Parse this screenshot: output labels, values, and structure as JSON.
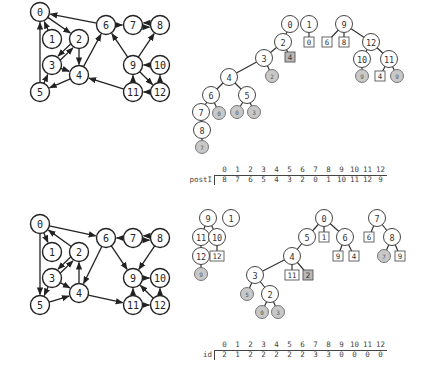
{
  "panels": [
    {
      "name": "top",
      "graph": {
        "nodes": [
          {
            "id": "0",
            "x": 40,
            "y": 12
          },
          {
            "id": "1",
            "x": 52,
            "y": 39
          },
          {
            "id": "2",
            "x": 79,
            "y": 39
          },
          {
            "id": "3",
            "x": 52,
            "y": 65
          },
          {
            "id": "4",
            "x": 79,
            "y": 75
          },
          {
            "id": "5",
            "x": 40,
            "y": 92
          },
          {
            "id": "6",
            "x": 106,
            "y": 25
          },
          {
            "id": "7",
            "x": 133,
            "y": 25
          },
          {
            "id": "8",
            "x": 160,
            "y": 25
          },
          {
            "id": "9",
            "x": 133,
            "y": 65
          },
          {
            "id": "10",
            "x": 160,
            "y": 65
          },
          {
            "id": "11",
            "x": 133,
            "y": 92
          },
          {
            "id": "12",
            "x": 160,
            "y": 92
          }
        ],
        "edges": [
          [
            "1",
            "0"
          ],
          [
            "0",
            "2"
          ],
          [
            "2",
            "3"
          ],
          [
            "3",
            "2"
          ],
          [
            "2",
            "4"
          ],
          [
            "3",
            "4"
          ],
          [
            "4",
            "5"
          ],
          [
            "5",
            "3"
          ],
          [
            "5",
            "0"
          ],
          [
            "4",
            "6"
          ],
          [
            "6",
            "0"
          ],
          [
            "6",
            "7"
          ],
          [
            "7",
            "8"
          ],
          [
            "8",
            "7"
          ],
          [
            "9",
            "6"
          ],
          [
            "9",
            "8"
          ],
          [
            "10",
            "9"
          ],
          [
            "9",
            "12"
          ],
          [
            "11",
            "9"
          ],
          [
            "12",
            "11"
          ],
          [
            "11",
            "4"
          ],
          [
            "12",
            "10"
          ]
        ]
      },
      "forest": {
        "nodes": [
          {
            "id": "t0",
            "label": "0",
            "x": 290,
            "y": 24,
            "kind": "circle"
          },
          {
            "id": "t2",
            "label": "2",
            "x": 283,
            "y": 42,
            "kind": "circle"
          },
          {
            "id": "t4b",
            "label": "4",
            "x": 290,
            "y": 57,
            "kind": "box-grey"
          },
          {
            "id": "t3",
            "label": "3",
            "x": 264,
            "y": 58,
            "kind": "circle"
          },
          {
            "id": "t2g",
            "label": "2",
            "x": 272,
            "y": 76,
            "kind": "grey"
          },
          {
            "id": "t4",
            "label": "4",
            "x": 229,
            "y": 77,
            "kind": "circle"
          },
          {
            "id": "t6",
            "label": "6",
            "x": 211,
            "y": 95,
            "kind": "circle"
          },
          {
            "id": "t5",
            "label": "5",
            "x": 247,
            "y": 95,
            "kind": "circle"
          },
          {
            "id": "t7",
            "label": "7",
            "x": 201,
            "y": 112,
            "kind": "circle"
          },
          {
            "id": "t0g",
            "label": "0",
            "x": 219,
            "y": 113,
            "kind": "grey"
          },
          {
            "id": "t0g2",
            "label": "0",
            "x": 237,
            "y": 112,
            "kind": "grey"
          },
          {
            "id": "t3g",
            "label": "3",
            "x": 254,
            "y": 112,
            "kind": "grey"
          },
          {
            "id": "t8",
            "label": "8",
            "x": 202,
            "y": 130,
            "kind": "circle"
          },
          {
            "id": "t7g",
            "label": "7",
            "x": 202,
            "y": 147,
            "kind": "grey"
          },
          {
            "id": "t1",
            "label": "1",
            "x": 309,
            "y": 24,
            "kind": "circle"
          },
          {
            "id": "t0b",
            "label": "0",
            "x": 309,
            "y": 42,
            "kind": "box"
          },
          {
            "id": "t9",
            "label": "9",
            "x": 344,
            "y": 24,
            "kind": "circle"
          },
          {
            "id": "t6b",
            "label": "6",
            "x": 327,
            "y": 42,
            "kind": "box"
          },
          {
            "id": "t8b",
            "label": "8",
            "x": 344,
            "y": 42,
            "kind": "box"
          },
          {
            "id": "t12",
            "label": "12",
            "x": 371,
            "y": 42,
            "kind": "circle"
          },
          {
            "id": "t10",
            "label": "10",
            "x": 362,
            "y": 59,
            "kind": "circle"
          },
          {
            "id": "t11",
            "label": "11",
            "x": 389,
            "y": 59,
            "kind": "circle"
          },
          {
            "id": "t9g",
            "label": "9",
            "x": 362,
            "y": 76,
            "kind": "grey"
          },
          {
            "id": "t4b2",
            "label": "4",
            "x": 380,
            "y": 76,
            "kind": "box"
          },
          {
            "id": "t9g2",
            "label": "9",
            "x": 397,
            "y": 76,
            "kind": "grey"
          }
        ],
        "edges": [
          [
            "t0",
            "t2"
          ],
          [
            "t2",
            "t4b"
          ],
          [
            "t2",
            "t3"
          ],
          [
            "t3",
            "t2g"
          ],
          [
            "t3",
            "t4"
          ],
          [
            "t4",
            "t6"
          ],
          [
            "t4",
            "t5"
          ],
          [
            "t6",
            "t7"
          ],
          [
            "t6",
            "t0g"
          ],
          [
            "t5",
            "t0g2"
          ],
          [
            "t5",
            "t3g"
          ],
          [
            "t7",
            "t8"
          ],
          [
            "t8",
            "t7g"
          ],
          [
            "t1",
            "t0b"
          ],
          [
            "t9",
            "t6b"
          ],
          [
            "t9",
            "t8b"
          ],
          [
            "t9",
            "t12"
          ],
          [
            "t12",
            "t10"
          ],
          [
            "t12",
            "t11"
          ],
          [
            "t10",
            "t9g"
          ],
          [
            "t11",
            "t4b2"
          ],
          [
            "t11",
            "t9g2"
          ]
        ]
      },
      "array": {
        "label": "postI",
        "indices": [
          "0",
          "1",
          "2",
          "3",
          "4",
          "5",
          "6",
          "7",
          "8",
          "9",
          "10",
          "11",
          "12"
        ],
        "values": [
          "8",
          "7",
          "6",
          "5",
          "4",
          "3",
          "2",
          "0",
          "1",
          "10",
          "11",
          "12",
          "9"
        ],
        "x": 218,
        "y": 165
      }
    },
    {
      "name": "bottom",
      "graph": {
        "nodes": [
          {
            "id": "0",
            "x": 40,
            "y": 224
          },
          {
            "id": "1",
            "x": 52,
            "y": 252
          },
          {
            "id": "2",
            "x": 79,
            "y": 252
          },
          {
            "id": "3",
            "x": 52,
            "y": 278
          },
          {
            "id": "4",
            "x": 79,
            "y": 293
          },
          {
            "id": "5",
            "x": 40,
            "y": 305
          },
          {
            "id": "6",
            "x": 106,
            "y": 238
          },
          {
            "id": "7",
            "x": 133,
            "y": 238
          },
          {
            "id": "8",
            "x": 160,
            "y": 238
          },
          {
            "id": "9",
            "x": 133,
            "y": 278
          },
          {
            "id": "10",
            "x": 160,
            "y": 278
          },
          {
            "id": "11",
            "x": 133,
            "y": 305
          },
          {
            "id": "12",
            "x": 160,
            "y": 305
          }
        ],
        "edges": [
          [
            "0",
            "1"
          ],
          [
            "2",
            "0"
          ],
          [
            "0",
            "5"
          ],
          [
            "0",
            "6"
          ],
          [
            "3",
            "2"
          ],
          [
            "2",
            "3"
          ],
          [
            "4",
            "2"
          ],
          [
            "3",
            "4"
          ],
          [
            "3",
            "5"
          ],
          [
            "5",
            "4"
          ],
          [
            "6",
            "4"
          ],
          [
            "6",
            "9"
          ],
          [
            "7",
            "6"
          ],
          [
            "7",
            "8"
          ],
          [
            "8",
            "7"
          ],
          [
            "8",
            "9"
          ],
          [
            "9",
            "10"
          ],
          [
            "11",
            "9"
          ],
          [
            "12",
            "9"
          ],
          [
            "4",
            "11"
          ],
          [
            "11",
            "12"
          ],
          [
            "12",
            "10"
          ]
        ]
      },
      "forest": {
        "nodes": [
          {
            "id": "b9",
            "label": "9",
            "x": 208,
            "y": 218,
            "kind": "circle"
          },
          {
            "id": "b1",
            "label": "1",
            "x": 231,
            "y": 218,
            "kind": "circle"
          },
          {
            "id": "b11",
            "label": "11",
            "x": 201,
            "y": 237,
            "kind": "circle"
          },
          {
            "id": "b10",
            "label": "10",
            "x": 217,
            "y": 237,
            "kind": "circle"
          },
          {
            "id": "b12",
            "label": "12",
            "x": 201,
            "y": 256,
            "kind": "circle"
          },
          {
            "id": "b12b",
            "label": "12",
            "x": 217,
            "y": 256,
            "kind": "box"
          },
          {
            "id": "b9g",
            "label": "9",
            "x": 201,
            "y": 274,
            "kind": "grey"
          },
          {
            "id": "b0",
            "label": "0",
            "x": 324,
            "y": 218,
            "kind": "circle"
          },
          {
            "id": "b5",
            "label": "5",
            "x": 307,
            "y": 237,
            "kind": "circle"
          },
          {
            "id": "b1b",
            "label": "1",
            "x": 324,
            "y": 237,
            "kind": "box"
          },
          {
            "id": "b6",
            "label": "6",
            "x": 345,
            "y": 237,
            "kind": "circle"
          },
          {
            "id": "b9b",
            "label": "9",
            "x": 338,
            "y": 256,
            "kind": "box"
          },
          {
            "id": "b4b",
            "label": "4",
            "x": 354,
            "y": 256,
            "kind": "box"
          },
          {
            "id": "b4",
            "label": "4",
            "x": 292,
            "y": 256,
            "kind": "circle"
          },
          {
            "id": "b11b",
            "label": "11",
            "x": 292,
            "y": 275,
            "kind": "box"
          },
          {
            "id": "b2b",
            "label": "2",
            "x": 308,
            "y": 275,
            "kind": "box-grey"
          },
          {
            "id": "b3",
            "label": "3",
            "x": 255,
            "y": 275,
            "kind": "circle"
          },
          {
            "id": "b5g",
            "label": "5",
            "x": 247,
            "y": 294,
            "kind": "grey"
          },
          {
            "id": "b2",
            "label": "2",
            "x": 270,
            "y": 294,
            "kind": "circle"
          },
          {
            "id": "b0g",
            "label": "0",
            "x": 262,
            "y": 312,
            "kind": "grey"
          },
          {
            "id": "b3g",
            "label": "3",
            "x": 278,
            "y": 312,
            "kind": "grey"
          },
          {
            "id": "b7",
            "label": "7",
            "x": 377,
            "y": 218,
            "kind": "circle"
          },
          {
            "id": "b6b",
            "label": "6",
            "x": 369,
            "y": 237,
            "kind": "box"
          },
          {
            "id": "b8",
            "label": "8",
            "x": 392,
            "y": 237,
            "kind": "circle"
          },
          {
            "id": "b7g",
            "label": "7",
            "x": 384,
            "y": 256,
            "kind": "grey"
          },
          {
            "id": "b9b2",
            "label": "9",
            "x": 400,
            "y": 256,
            "kind": "box"
          }
        ],
        "edges": [
          [
            "b9",
            "b11"
          ],
          [
            "b9",
            "b10"
          ],
          [
            "b11",
            "b12"
          ],
          [
            "b10",
            "b12b"
          ],
          [
            "b12",
            "b9g"
          ],
          [
            "b0",
            "b5"
          ],
          [
            "b0",
            "b1b"
          ],
          [
            "b0",
            "b6"
          ],
          [
            "b6",
            "b9b"
          ],
          [
            "b6",
            "b4b"
          ],
          [
            "b5",
            "b4"
          ],
          [
            "b4",
            "b11b"
          ],
          [
            "b4",
            "b2b"
          ],
          [
            "b4",
            "b3"
          ],
          [
            "b3",
            "b5g"
          ],
          [
            "b3",
            "b2"
          ],
          [
            "b2",
            "b0g"
          ],
          [
            "b2",
            "b3g"
          ],
          [
            "b7",
            "b6b"
          ],
          [
            "b7",
            "b8"
          ],
          [
            "b8",
            "b7g"
          ],
          [
            "b8",
            "b9b2"
          ]
        ]
      },
      "array": {
        "label": "id",
        "indices": [
          "0",
          "1",
          "2",
          "3",
          "4",
          "5",
          "6",
          "7",
          "8",
          "9",
          "10",
          "11",
          "12"
        ],
        "values": [
          "2",
          "1",
          "2",
          "2",
          "2",
          "2",
          "2",
          "3",
          "3",
          "0",
          "0",
          "0",
          "0"
        ],
        "x": 218,
        "y": 340
      }
    }
  ]
}
